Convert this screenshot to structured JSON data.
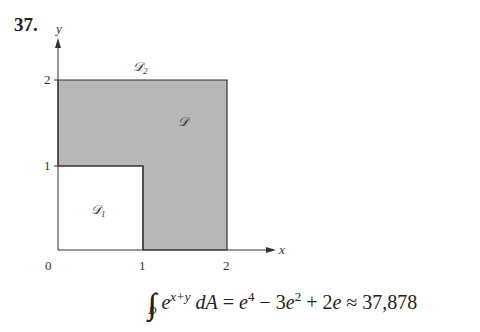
{
  "problem_number": "37.",
  "diagram": {
    "axes": {
      "x_label": "x",
      "y_label": "y",
      "origin_label": "0"
    },
    "x_ticks": [
      "1",
      "2"
    ],
    "y_ticks": [
      "1",
      "2"
    ],
    "regions": [
      {
        "name": "D",
        "label": "𝒟",
        "description": "shaded L-shaped region: [0,2]×[0,2] minus [0,1]×[0,1]"
      },
      {
        "name": "D1",
        "label": "𝒟",
        "subscript": "1",
        "description": "unshaded square [0,1]×[0,1]"
      },
      {
        "name": "D2",
        "label": "𝒟",
        "subscript": "2",
        "description": "full square [0,2]×[0,2]"
      }
    ],
    "colors": {
      "shade": "#b8b8b8",
      "line": "#333333"
    }
  },
  "formula": {
    "integral_sub": "D",
    "integrand_base": "e",
    "integrand_exp": "x+y",
    "differential": "dA",
    "rhs": "= e⁴ − 3e² + 2e ≈ 37,878",
    "rhs_parts": [
      "= ",
      "e",
      "4",
      " − 3",
      "e",
      "2",
      " + 2",
      "e",
      " ≈ 37,878"
    ]
  }
}
